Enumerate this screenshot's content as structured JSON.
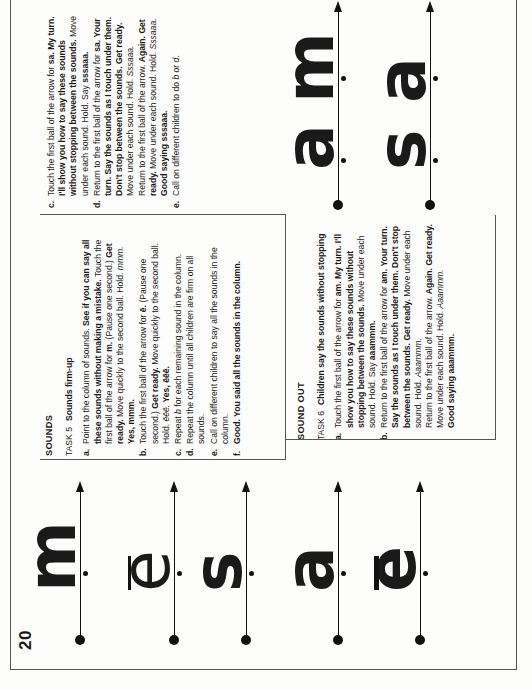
{
  "page": {
    "number": "20",
    "orientation": "rotated 90 degrees counter-clockwise"
  },
  "sounds_section": {
    "heading": "SOUNDS",
    "task_number": "TASK 5",
    "task_title": "Sounds firm-up",
    "steps": [
      {
        "label": "a.",
        "parts": [
          {
            "t": "Point to the column of sounds. "
          },
          {
            "t": "See if you can say all these sounds without making a mistake.",
            "b": true
          },
          {
            "t": " Touch the first ball of the arrow for "
          },
          {
            "t": "m.",
            "b": true
          },
          {
            "t": " (Pause one second.) "
          },
          {
            "t": "Get ready.",
            "b": true
          },
          {
            "t": " Move quickly to the second ball. Hold. "
          },
          {
            "t": "mmm.",
            "i": true
          },
          {
            "t": " "
          },
          {
            "t": "Yes, mmm.",
            "b": true
          }
        ]
      },
      {
        "label": "b.",
        "parts": [
          {
            "t": "Touch the first ball of the arrow for "
          },
          {
            "t": "ē.",
            "b": true
          },
          {
            "t": " (Pause one second.) "
          },
          {
            "t": "Get ready.",
            "b": true
          },
          {
            "t": " Move quickly to the second ball. Hold. "
          },
          {
            "t": "ēēē.",
            "i": true
          },
          {
            "t": " "
          },
          {
            "t": "Yes, ēēē.",
            "b": true
          }
        ]
      },
      {
        "label": "c.",
        "parts": [
          {
            "t": "Repeat "
          },
          {
            "t": "b",
            "i": true
          },
          {
            "t": " for each remaining sound in the column."
          }
        ]
      },
      {
        "label": "d.",
        "parts": [
          {
            "t": "Repeat the column until all children are firm on all sounds."
          }
        ]
      },
      {
        "label": "e.",
        "parts": [
          {
            "t": "Call on different children to say all the sounds in the column."
          }
        ]
      },
      {
        "label": "f.",
        "parts": [
          {
            "t": "Good. You said all the sounds in the column.",
            "b": true
          }
        ]
      }
    ]
  },
  "sound_out_section": {
    "heading": "SOUND OUT",
    "task_number": "TASK 6",
    "task_title": "Children say the sounds without stopping",
    "steps": [
      {
        "label": "a.",
        "parts": [
          {
            "t": "Touch the first ball of the arrow for "
          },
          {
            "t": "am.",
            "b": true
          },
          {
            "t": " "
          },
          {
            "t": "My turn. I'll show you how to say these sounds without stopping between the sounds.",
            "b": true
          },
          {
            "t": " Move under each sound. Hold. Say "
          },
          {
            "t": "aaammm.",
            "b": true
          }
        ]
      },
      {
        "label": "b.",
        "parts": [
          {
            "t": "Return to the first ball of the arrow for "
          },
          {
            "t": "am.",
            "b": true
          },
          {
            "t": " "
          },
          {
            "t": "Your turn. Say the sounds as I touch under them. Don't stop between the sounds. Get ready.",
            "b": true
          },
          {
            "t": " Move under each sound. Hold. "
          },
          {
            "t": "Aaammm.",
            "i": true
          },
          {
            "br": true
          },
          {
            "t": "Return to the first ball of the arrow. "
          },
          {
            "t": "Again. Get ready.",
            "b": true
          },
          {
            "t": " Move under each sound. Hold. "
          },
          {
            "t": "Aaammm.",
            "i": true
          },
          {
            "br": true
          },
          {
            "t": "Good saying aaammm.",
            "b": true
          }
        ]
      }
    ]
  },
  "continuation_section": {
    "steps": [
      {
        "label": "c.",
        "parts": [
          {
            "t": "Touch the first ball of the arrow for "
          },
          {
            "t": "sa.",
            "b": true
          },
          {
            "t": " "
          },
          {
            "t": "My turn. I'll show you how to say these sounds without stopping between the sounds.",
            "b": true
          },
          {
            "t": " Move under each sound. Hold. Say "
          },
          {
            "t": "sssaaa.",
            "b": true
          }
        ]
      },
      {
        "label": "d.",
        "parts": [
          {
            "t": "Return to the first ball of the arrow for "
          },
          {
            "t": "sa.",
            "b": true
          },
          {
            "t": " "
          },
          {
            "t": "Your turn. Say the sounds as I touch under them. Don't stop between the sounds. Get ready.",
            "b": true
          },
          {
            "t": " Move under each sound. Hold. "
          },
          {
            "t": "Sssaaa.",
            "i": true
          },
          {
            "br": true
          },
          {
            "t": "Return to the first ball of the arrow. "
          },
          {
            "t": "Again. Get ready.",
            "b": true
          },
          {
            "t": " Move under each sound. Hold. "
          },
          {
            "t": "Sssaaa.",
            "i": true
          },
          {
            "br": true
          },
          {
            "t": "Good saying sssaaa.",
            "b": true
          }
        ]
      },
      {
        "label": "e.",
        "parts": [
          {
            "t": "Call on different children to do "
          },
          {
            "t": "b",
            "i": true
          },
          {
            "t": " or "
          },
          {
            "t": "d",
            "i": true
          },
          {
            "t": "."
          }
        ]
      }
    ]
  },
  "sound_column": {
    "items": [
      {
        "letter": "m",
        "macron": false,
        "style": "bold"
      },
      {
        "letter": "e",
        "macron": true,
        "style": "light"
      },
      {
        "letter": "s",
        "macron": false,
        "style": "bold"
      },
      {
        "letter": "a",
        "macron": false,
        "style": "bold"
      },
      {
        "letter": "e",
        "macron": true,
        "style": "bold"
      }
    ]
  },
  "sound_out_words": {
    "items": [
      {
        "word": "am",
        "letters": [
          "a",
          "m"
        ]
      },
      {
        "word": "sa",
        "letters": [
          "s",
          "a"
        ]
      }
    ]
  },
  "colors": {
    "ink": "#111111",
    "rule": "#555555",
    "paper": "#fdfdfc"
  }
}
